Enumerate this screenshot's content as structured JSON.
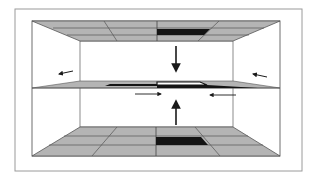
{
  "diagram": {
    "type": "room-cross-section",
    "colors": {
      "background": "#ffffff",
      "frame": "#9a9a9a",
      "tile_fill": "#b4b4b4",
      "tile_line": "#555555",
      "dark_tile": "#141414",
      "wall_line": "#6e6e6e",
      "arrow": "#1a1a1a"
    },
    "elements": {
      "ceiling": {
        "label": "ceiling-grid",
        "highlighted_tile": "dark"
      },
      "floor": {
        "label": "floor-grid",
        "highlighted_tile": "dark"
      },
      "mid_plane": {
        "label": "middle-plane",
        "highlighted_tiles": [
          "dark",
          "white",
          "dark"
        ]
      },
      "arrows": [
        {
          "name": "arrow-down-center",
          "direction": "down"
        },
        {
          "name": "arrow-up-center",
          "direction": "up"
        },
        {
          "name": "arrow-left-outer",
          "direction": "left"
        },
        {
          "name": "arrow-right-outer",
          "direction": "left"
        },
        {
          "name": "arrow-mid-right",
          "direction": "right"
        },
        {
          "name": "arrow-mid-left",
          "direction": "left"
        }
      ]
    }
  }
}
